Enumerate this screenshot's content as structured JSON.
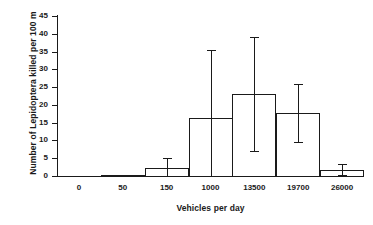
{
  "chart_data": {
    "type": "bar",
    "title": "",
    "xlabel": "Vehicles per day",
    "ylabel": "Number of Lepidoptera killed per 100 m",
    "categories": [
      "0",
      "50",
      "150",
      "1000",
      "13500",
      "19700",
      "26000"
    ],
    "values": [
      0,
      0.2,
      2.2,
      16.4,
      23.0,
      17.7,
      1.6
    ],
    "error_high": [
      0,
      0.2,
      5.0,
      35.3,
      39.2,
      25.9,
      3.4
    ],
    "error_low": [
      0,
      0.2,
      -0.3,
      0.0,
      7.1,
      9.7,
      0.4
    ],
    "ylim": [
      0,
      45
    ],
    "yticks": [
      0,
      5,
      10,
      15,
      20,
      25,
      30,
      35,
      40,
      45
    ],
    "ytick_labels": [
      "0",
      "5",
      "10",
      "15",
      "20",
      "25",
      "30",
      "35",
      "40",
      "45"
    ],
    "grid": false,
    "legend": false,
    "bar_fill": "#ffffff",
    "bar_edge": "#1a1a1a",
    "axis_color": "#1a1a1a",
    "background": "#ffffff"
  }
}
